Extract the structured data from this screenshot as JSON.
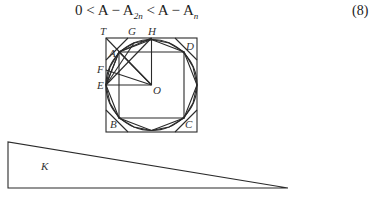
{
  "equation": {
    "lhs": "0 <",
    "term1_base": "A − A",
    "term1_sub": "2n",
    "mid": " < ",
    "term2_base": "A − A",
    "term2_sub": "n",
    "number": "(8)"
  },
  "diagram": {
    "labels": {
      "T": "T",
      "G": "G",
      "H": "H",
      "D": "D",
      "A": "A",
      "F": "F",
      "E": "E",
      "O": "O",
      "B": "B",
      "C": "C"
    },
    "colors": {
      "stroke": "#2a2a2a",
      "label": "#333333"
    }
  },
  "triangle": {
    "label": "K"
  }
}
